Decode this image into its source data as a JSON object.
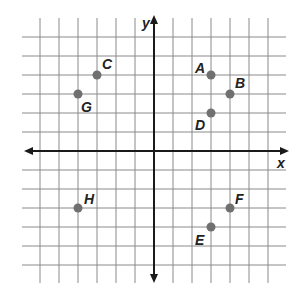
{
  "graph": {
    "x_axis_label": "x",
    "y_axis_label": "y",
    "grid_min": -6,
    "grid_max": 6,
    "origin_px": [
      154,
      151
    ],
    "unit_px": 19,
    "colors": {
      "grid": "#8a8a8a",
      "axis": "#1a1a1a",
      "point": "#707070",
      "label": "#222222"
    }
  },
  "points": [
    {
      "name": "A",
      "x": 3,
      "y": 4,
      "label_dx": -16,
      "label_dy": -2
    },
    {
      "name": "B",
      "x": 4,
      "y": 3,
      "label_dx": 5,
      "label_dy": -6
    },
    {
      "name": "C",
      "x": -3,
      "y": 4,
      "label_dx": 5,
      "label_dy": -6
    },
    {
      "name": "D",
      "x": 3,
      "y": 2,
      "label_dx": -16,
      "label_dy": 17
    },
    {
      "name": "E",
      "x": 3,
      "y": -4,
      "label_dx": -16,
      "label_dy": 18
    },
    {
      "name": "F",
      "x": 4,
      "y": -3,
      "label_dx": 5,
      "label_dy": -4
    },
    {
      "name": "G",
      "x": -4,
      "y": 3,
      "label_dx": 3,
      "label_dy": 18
    },
    {
      "name": "H",
      "x": -4,
      "y": -3,
      "label_dx": 6,
      "label_dy": -4
    }
  ]
}
